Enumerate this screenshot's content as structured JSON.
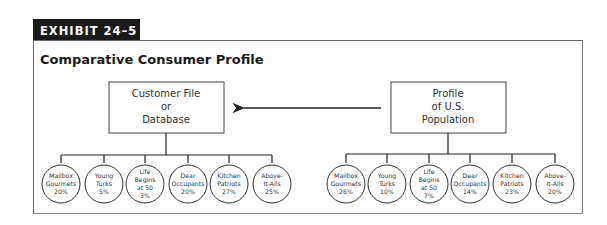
{
  "exhibit": {
    "label": "EXHIBIT 24–5"
  },
  "title": "Comparative Consumer Profile",
  "left_box": {
    "lines": [
      "Customer File",
      "or",
      "Database"
    ]
  },
  "right_box": {
    "lines": [
      "Profile",
      "of U.S.",
      "Population"
    ]
  },
  "arrow": {
    "direction": "from-right-box-to-left-box"
  },
  "left_segments": [
    {
      "lines": [
        "Mailbox",
        "Gourmets"
      ],
      "pct": "20%"
    },
    {
      "lines": [
        "Young",
        "Turks"
      ],
      "pct": "5%"
    },
    {
      "lines": [
        "Life",
        "Begins",
        "at 50"
      ],
      "pct": "3%"
    },
    {
      "lines": [
        "Dear",
        "Occupants"
      ],
      "pct": "20%"
    },
    {
      "lines": [
        "Kitchen",
        "Patriots"
      ],
      "pct": "27%"
    },
    {
      "lines": [
        "Above-",
        "It-Alls"
      ],
      "pct": "25%"
    }
  ],
  "right_segments": [
    {
      "lines": [
        "Mailbox",
        "Gourmets"
      ],
      "pct": "26%"
    },
    {
      "lines": [
        "Young",
        "Turks"
      ],
      "pct": "10%"
    },
    {
      "lines": [
        "Life",
        "Begins",
        "at 50"
      ],
      "pct": "7%"
    },
    {
      "lines": [
        "Dear",
        "Occupants"
      ],
      "pct": "14%"
    },
    {
      "lines": [
        "Kitchen",
        "Patriots"
      ],
      "pct": "23%"
    },
    {
      "lines": [
        "Above-",
        "It-Alls"
      ],
      "pct": "20%"
    }
  ]
}
